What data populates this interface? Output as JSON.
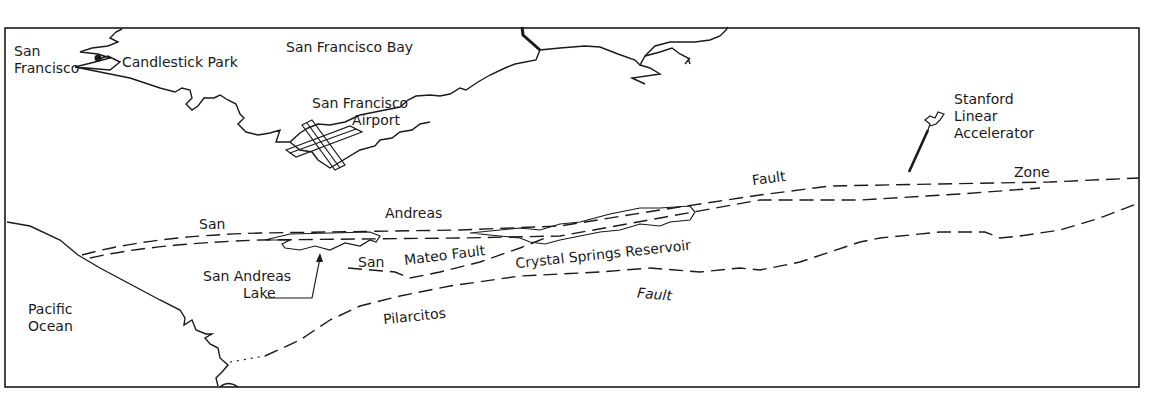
{
  "map": {
    "colors": {
      "ink": "#1a1a1a",
      "background": "#ffffff"
    },
    "labels": {
      "san_francisco": "San\nFrancisco",
      "candlestick_park": "Candlestick Park",
      "sf_bay": "San Francisco Bay",
      "sf_airport": "San Francisco\n         Airport",
      "stanford": "Stanford\nLinear\nAccelerator",
      "fault_upper": "Fault",
      "zone": "Zone",
      "san_1": "San",
      "andreas": "Andreas",
      "san_2": "San",
      "mateo_fault": "Mateo Fault",
      "crystal_springs": "Crystal Springs Reservoir",
      "san_andreas_lake": "San Andreas\n         Lake",
      "pacific_ocean": "Pacific\nOcean",
      "fault_lower": "Fault",
      "pilarcitos": "Pilarcitos"
    }
  }
}
